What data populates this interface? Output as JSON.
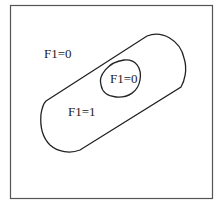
{
  "diagram": {
    "type": "region-diagram",
    "frame": {
      "x": 10,
      "y": 5,
      "w": 203,
      "h": 194
    },
    "regions": [
      {
        "id": "outer",
        "label": "F1=0",
        "desc": "area outside capsule"
      },
      {
        "id": "capsule",
        "label": "F1=1",
        "desc": "slanted capsule region"
      },
      {
        "id": "inner",
        "label": "F1=0",
        "desc": "oval hole inside capsule"
      }
    ],
    "colors": {
      "stroke": "#222222",
      "background": "#ffffff"
    }
  },
  "labels": {
    "outer": "F1=0",
    "capsule": "F1=1",
    "inner": "F1=0"
  }
}
